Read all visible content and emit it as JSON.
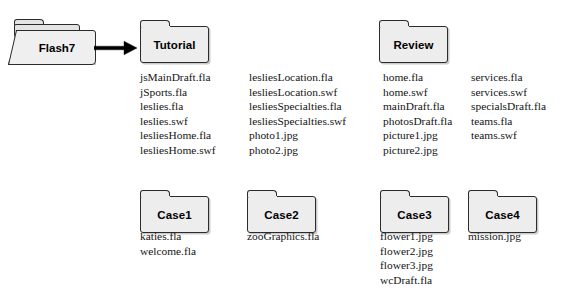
{
  "diagram": {
    "root": {
      "name": "Flash7",
      "icon": "open-folder-icon"
    },
    "arrow": {
      "icon": "right-arrow-icon"
    },
    "folders": [
      {
        "id": "tutorial",
        "name": "Tutorial",
        "icon": "folder-icon",
        "columns": [
          {
            "id": "tutorial-col1",
            "files": [
              "jsMainDraft.fla",
              "jSports.fla",
              "leslies.fla",
              "leslies.swf",
              "lesliesHome.fla",
              "lesliesHome.swf"
            ]
          },
          {
            "id": "tutorial-col2",
            "files": [
              "lesliesLocation.fla",
              "lesliesLocation.swf",
              "lesliesSpecialties.fla",
              "lesliesSpecialties.swf",
              "photo1.jpg",
              "photo2.jpg"
            ]
          }
        ]
      },
      {
        "id": "review",
        "name": "Review",
        "icon": "folder-icon",
        "columns": [
          {
            "id": "review-col1",
            "files": [
              "home.fla",
              "home.swf",
              "mainDraft.fla",
              "photosDraft.fla",
              "picture1.jpg",
              "picture2.jpg"
            ]
          },
          {
            "id": "review-col2",
            "files": [
              "services.fla",
              "services.swf",
              "specialsDraft.fla",
              "teams.fla",
              "teams.swf"
            ]
          }
        ]
      },
      {
        "id": "case1",
        "name": "Case1",
        "icon": "folder-icon",
        "columns": [
          {
            "id": "case1-col1",
            "files": [
              "katies.fla",
              "welcome.fla"
            ]
          }
        ]
      },
      {
        "id": "case2",
        "name": "Case2",
        "icon": "folder-icon",
        "columns": [
          {
            "id": "case2-col1",
            "files": [
              "zooGraphics.fla"
            ]
          }
        ]
      },
      {
        "id": "case3",
        "name": "Case3",
        "icon": "folder-icon",
        "columns": [
          {
            "id": "case3-col1",
            "files": [
              "flower1.jpg",
              "flower2.jpg",
              "flower3.jpg",
              "wcDraft.fla"
            ]
          }
        ]
      },
      {
        "id": "case4",
        "name": "Case4",
        "icon": "folder-icon",
        "columns": [
          {
            "id": "case4-col1",
            "files": [
              "mission.jpg"
            ]
          }
        ]
      }
    ],
    "colors": {
      "background": "#ffffff",
      "folder_fill": "#ededed",
      "folder_border": "#2b2b2b",
      "text": "#141414",
      "arrow": "#000000"
    }
  }
}
